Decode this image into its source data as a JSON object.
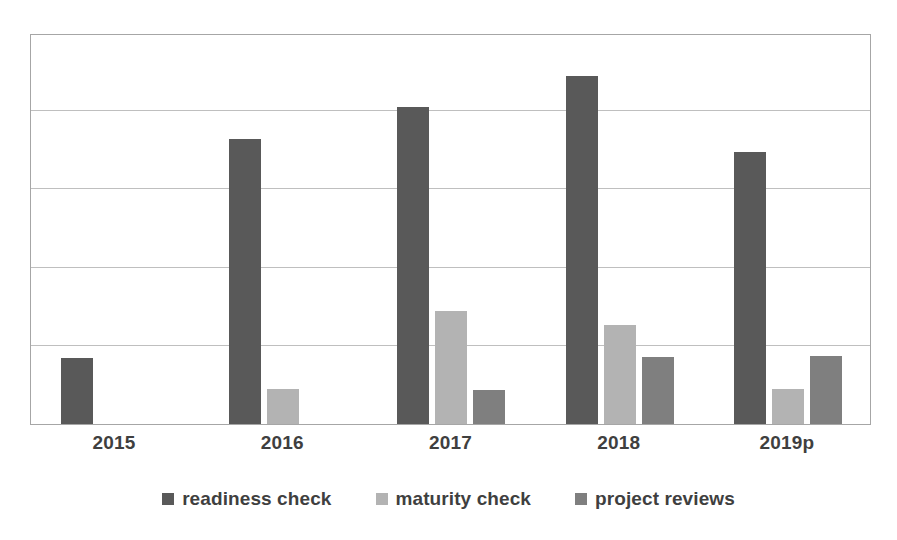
{
  "chart_data": {
    "type": "bar",
    "title": "",
    "subtitle": "",
    "xlabel": "",
    "ylabel": "",
    "grid": true,
    "legend_position": "bottom",
    "ylim": [
      0,
      500
    ],
    "y_gridline_values": [
      0,
      100,
      200,
      300,
      400,
      500
    ],
    "categories": [
      "2015",
      "2016",
      "2017",
      "2018",
      "2019p"
    ],
    "series": [
      {
        "name": "readiness check",
        "color": "#595959",
        "values": [
          85,
          365,
          405,
          445,
          348
        ]
      },
      {
        "name": "maturity check",
        "color": "#b3b3b3",
        "values": [
          null,
          45,
          145,
          127,
          45
        ]
      },
      {
        "name": "project reviews",
        "color": "#7f7f7f",
        "values": [
          null,
          null,
          44,
          86,
          87
        ]
      }
    ]
  },
  "axis": {
    "tick_labels": [
      "2015",
      "2016",
      "2017",
      "2018",
      "2019p"
    ]
  },
  "legend": {
    "items": [
      {
        "label": "readiness check",
        "color": "#595959",
        "swatch_name": "legend-swatch-readiness-check"
      },
      {
        "label": "maturity check",
        "color": "#b3b3b3",
        "swatch_name": "legend-swatch-maturity-check"
      },
      {
        "label": "project reviews",
        "color": "#7f7f7f",
        "swatch_name": "legend-swatch-project-reviews"
      }
    ]
  },
  "style": {
    "plot_border_color": "#a6a6a6",
    "gridline_color": "#bfbfbf",
    "background": "#ffffff",
    "label_color": "#3f3f3f"
  }
}
